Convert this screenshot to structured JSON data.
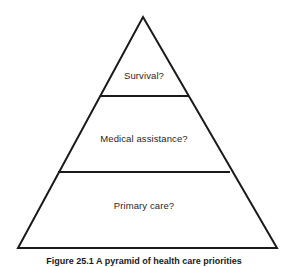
{
  "figure": {
    "type": "pyramid-diagram",
    "caption": "Figure 25.1  A pyramid of health care priorities",
    "background_color": "#ffffff",
    "stroke_color": "#1a1a1a",
    "text_color": "#1f1f1f",
    "geometry": {
      "apex": [
        143,
        17
      ],
      "base_left": [
        18,
        248
      ],
      "base_right": [
        277,
        248
      ],
      "divider_1_y": 96,
      "divider_1_x": [
        100,
        188
      ],
      "divider_2_y": 172,
      "divider_2_x": [
        58,
        230
      ]
    },
    "tiers": [
      {
        "id": "tier-top",
        "label": "Survival?",
        "level": 1,
        "position": "top"
      },
      {
        "id": "tier-middle",
        "label": "Medical assistance?",
        "level": 2,
        "position": "middle"
      },
      {
        "id": "tier-bottom",
        "label": "Primary care?",
        "level": 3,
        "position": "bottom"
      }
    ]
  }
}
